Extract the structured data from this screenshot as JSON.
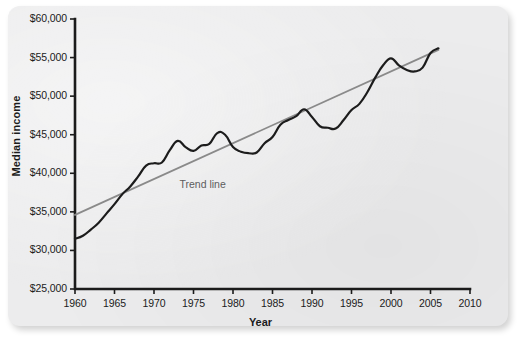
{
  "chart_data": {
    "type": "line",
    "title": "",
    "xlabel": "Year",
    "ylabel": "Median income",
    "xlim": [
      1960,
      2010
    ],
    "ylim": [
      25000,
      60000
    ],
    "grid": false,
    "legend_position": "inline-annotation",
    "annotations": [
      {
        "text": "Trend line",
        "x": 1975,
        "y": 38500
      }
    ],
    "xticks": [
      "1960",
      "1965",
      "1970",
      "1975",
      "1980",
      "1985",
      "1990",
      "1995",
      "2000",
      "2005",
      "2010"
    ],
    "xtick_values": [
      1960,
      1965,
      1970,
      1975,
      1980,
      1985,
      1990,
      1995,
      2000,
      2005,
      2010
    ],
    "yticks": [
      "$25,000",
      "$30,000",
      "$35,000",
      "$40,000",
      "$45,000",
      "$50,000",
      "$55,000",
      "$60,000"
    ],
    "ytick_values": [
      25000,
      30000,
      35000,
      40000,
      45000,
      50000,
      55000,
      60000
    ],
    "series": [
      {
        "name": "Median income",
        "color": "#1c1c1c",
        "width": 2.2,
        "x": [
          1960,
          1961,
          1962,
          1963,
          1964,
          1965,
          1966,
          1967,
          1968,
          1969,
          1970,
          1971,
          1972,
          1973,
          1974,
          1975,
          1976,
          1977,
          1978,
          1979,
          1980,
          1981,
          1982,
          1983,
          1984,
          1985,
          1986,
          1987,
          1988,
          1989,
          1990,
          1991,
          1992,
          1993,
          1994,
          1995,
          1996,
          1997,
          1998,
          1999,
          2000,
          2001,
          2002,
          2003,
          2004,
          2005,
          2006
        ],
        "values": [
          31500,
          31900,
          32700,
          33600,
          34800,
          36000,
          37300,
          38300,
          39600,
          41000,
          41300,
          41400,
          43000,
          44200,
          43400,
          42900,
          43600,
          43800,
          45200,
          45000,
          43400,
          42800,
          42600,
          42700,
          43900,
          44700,
          46300,
          46900,
          47400,
          48300,
          47300,
          46100,
          45900,
          45800,
          46900,
          48200,
          49000,
          50500,
          52400,
          54000,
          54900,
          54000,
          53400,
          53200,
          53700,
          55600,
          56200
        ]
      },
      {
        "name": "Trend line",
        "color": "#8a8a8a",
        "width": 1.8,
        "x": [
          1960,
          2006
        ],
        "values": [
          34600,
          56000
        ]
      }
    ]
  }
}
